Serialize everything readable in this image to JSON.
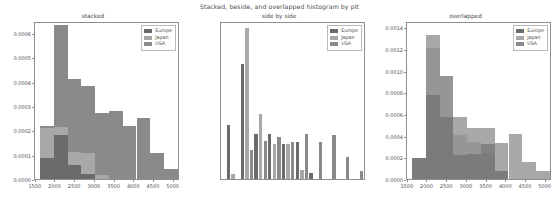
{
  "figure": {
    "suptitle": "Stacked, beside, and overlapped histogram by plt",
    "background": "#ffffff",
    "width": 559,
    "height": 205
  },
  "colors": {
    "europe": "#6b6b6b",
    "japan": "#a8a8a8",
    "usa": "#8a8a8a",
    "axis": "#8e8e8e",
    "text": "#4a4a4a"
  },
  "legend": {
    "entries": [
      {
        "label": "Europe",
        "color": "#6b6b6b"
      },
      {
        "label": "Japan",
        "color": "#a8a8a8"
      },
      {
        "label": "USA",
        "color": "#8a8a8a"
      }
    ]
  },
  "chart_data": [
    {
      "type": "bar",
      "id": "stacked",
      "title": "stacked",
      "mode": "stacked-histogram",
      "xlabel": "",
      "ylabel": "",
      "xlim": [
        1480,
        5160
      ],
      "ylim": [
        0.0,
        0.00065
      ],
      "xticks": [
        1500,
        2000,
        2500,
        3000,
        3500,
        4000,
        4500,
        5000
      ],
      "xticklabels": [
        "1500",
        "2000",
        "2500",
        "3000",
        "3500",
        "4000",
        "4500",
        "5000"
      ],
      "yticks": [
        0.0,
        0.0001,
        0.0002,
        0.0003,
        0.0004,
        0.0005,
        0.0006
      ],
      "yticklabels": [
        "0.0000",
        "0.0001",
        "0.0002",
        "0.0003",
        "0.0004",
        "0.0005",
        "0.0006"
      ],
      "grid": false,
      "legend_position": "upper right",
      "bin_edges": [
        1613,
        1962,
        2311,
        2660,
        3009,
        3358,
        3707,
        4056,
        4405,
        4754,
        5103
      ],
      "categories": [
        "1613-1962",
        "1962-2311",
        "2311-2660",
        "2660-3009",
        "3009-3358",
        "3358-3707",
        "3707-4056",
        "4056-4405",
        "4405-4754",
        "4754-5103"
      ],
      "series": [
        {
          "name": "Europe",
          "color": "#6b6b6b",
          "values": [
            8.8e-05,
            0.000182,
            5.9e-05,
            2.1e-05,
            0.0,
            0.0,
            0.0,
            0.0,
            0.0,
            0.0
          ]
        },
        {
          "name": "Japan",
          "color": "#a8a8a8",
          "values": [
            0.000123,
            3e-05,
            5.3e-05,
            8.5e-05,
            1.6e-05,
            0.0,
            0.0,
            0.0,
            0.0,
            0.0
          ]
        },
        {
          "name": "USA",
          "color": "#8a8a8a",
          "values": [
            9e-06,
            0.00042,
            0.000298,
            0.000275,
            0.000257,
            0.00028,
            0.00022,
            0.000251,
            0.000108,
            4.2e-05
          ]
        }
      ],
      "stack_totals": [
        0.00022,
        0.000632,
        0.00041,
        0.000381,
        0.000273,
        0.00028,
        0.00022,
        0.000251,
        0.000108,
        4.2e-05
      ]
    },
    {
      "type": "bar",
      "id": "side-by-side",
      "title": "side by side",
      "mode": "grouped-histogram",
      "xlabel": "",
      "ylabel": "",
      "xlim": [
        1480,
        5160
      ],
      "ylim": [
        0.0,
        0.00146
      ],
      "xticks": [
        1500,
        2000,
        2500,
        3000,
        3500,
        4000,
        4500,
        5000
      ],
      "xticklabels": [
        "1500",
        "2000",
        "2500",
        "3000",
        "3500",
        "4000",
        "4500",
        "5000"
      ],
      "yticks": [
        0.0,
        0.0002,
        0.0004,
        0.0006,
        0.0008,
        0.001,
        0.0012,
        0.0014
      ],
      "yticklabels": [
        "0.0000",
        "0.0002",
        "0.0004",
        "0.0006",
        "0.0008",
        "0.0010",
        "0.0012",
        "0.0014"
      ],
      "grid": false,
      "legend_position": "upper right",
      "bin_edges": [
        1613,
        1962,
        2311,
        2660,
        3009,
        3358,
        3707,
        4056,
        4405,
        4754,
        5103
      ],
      "categories": [
        "1613-1962",
        "1962-2311",
        "2311-2660",
        "2660-3009",
        "3009-3358",
        "3358-3707",
        "3707-4056",
        "4056-4405",
        "4405-4754",
        "4754-5103"
      ],
      "series": [
        {
          "name": "Europe",
          "color": "#6b6b6b",
          "values": [
            0.0005,
            0.00106,
            0.00042,
            0.00042,
            0.00032,
            0.000345,
            5.2e-05,
            0.0,
            0.0,
            0.0
          ]
        },
        {
          "name": "Japan",
          "color": "#a8a8a8",
          "values": [
            4.8e-05,
            0.0014,
            0.000605,
            0.000325,
            0.00032,
            8e-05,
            0.0,
            0.0,
            0.0,
            0.0
          ]
        },
        {
          "name": "USA",
          "color": "#8a8a8a",
          "values": [
            0.0,
            0.00027,
            0.00035,
            0.00039,
            0.000345,
            0.00042,
            0.000345,
            0.000405,
            0.000208,
            7.8e-05
          ]
        }
      ]
    },
    {
      "type": "bar",
      "id": "overlapped",
      "title": "overlapped",
      "mode": "overlapped-histogram",
      "xlabel": "",
      "ylabel": "",
      "xlim": [
        1480,
        5160
      ],
      "ylim": [
        0.0,
        0.00146
      ],
      "xticks": [
        1500,
        2000,
        2500,
        3000,
        3500,
        4000,
        4500,
        5000
      ],
      "xticklabels": [
        "1500",
        "2000",
        "2500",
        "3000",
        "3500",
        "4000",
        "4500",
        "5000"
      ],
      "yticks": [
        0.0,
        0.0002,
        0.0004,
        0.0006,
        0.0008,
        0.001,
        0.0012,
        0.0014
      ],
      "yticklabels": [
        "0.0000",
        "0.0002",
        "0.0004",
        "0.0006",
        "0.0008",
        "0.0010",
        "0.0012",
        "0.0014"
      ],
      "grid": false,
      "legend_position": "upper right",
      "bin_edges": [
        1613,
        1962,
        2311,
        2660,
        3009,
        3358,
        3707,
        4056,
        4405,
        4754,
        5103
      ],
      "categories": [
        "1613-1962",
        "1962-2311",
        "2311-2660",
        "2660-3009",
        "3009-3358",
        "3358-3707",
        "3707-4056",
        "4056-4405",
        "4405-4754",
        "4754-5103"
      ],
      "series": [
        {
          "name": "Europe",
          "color": "#6b6b6b",
          "values": [
            0.00019,
            0.000775,
            0.00057,
            0.000218,
            0.00023,
            0.000325,
            7e-05,
            0.0,
            0.0,
            0.0
          ]
        },
        {
          "name": "Japan",
          "color": "#a8a8a8",
          "values": [
            0.00019,
            0.001335,
            0.000955,
            0.00057,
            0.000475,
            0.00047,
            0.00033,
            0.000415,
            0.000155,
            7.8e-05
          ]
        },
        {
          "name": "USA",
          "color": "#8a8a8a",
          "values": [
            0.00019,
            0.001215,
            0.000955,
            0.000405,
            0.00034,
            0.00024,
            7e-05,
            0.0,
            0.0,
            0.0
          ]
        }
      ]
    }
  ]
}
